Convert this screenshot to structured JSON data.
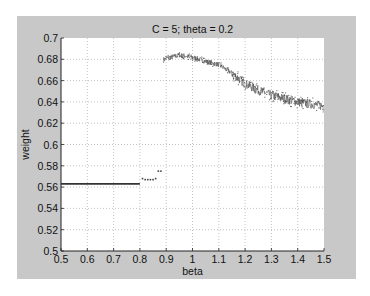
{
  "chart_data": {
    "type": "scatter",
    "title": "C = 5; theta = 0.2",
    "xlabel": "beta",
    "ylabel": "weight",
    "xlim": [
      0.5,
      1.5
    ],
    "ylim": [
      0.5,
      0.7
    ],
    "grid": true,
    "xticks": [
      0.5,
      0.6,
      0.7,
      0.8,
      0.9,
      1,
      1.1,
      1.2,
      1.3,
      1.4,
      1.5
    ],
    "xtick_labels": [
      "0.5",
      "0.6",
      "0.7",
      "0.8",
      "0.9",
      "1",
      "1.1",
      "1.2",
      "1.3",
      "1.4",
      "1.5"
    ],
    "yticks": [
      0.5,
      0.52,
      0.54,
      0.56,
      0.58,
      0.6,
      0.62,
      0.64,
      0.66,
      0.68,
      0.7
    ],
    "ytick_labels": [
      "0.5",
      "0.52",
      "0.54",
      "0.56",
      "0.58",
      "0.6",
      "0.62",
      "0.64",
      "0.66",
      "0.68",
      "0.7"
    ],
    "series": [
      {
        "name": "low-regime",
        "description": "flat segment",
        "x": [
          0.5,
          0.55,
          0.6,
          0.65,
          0.7,
          0.75,
          0.8
        ],
        "y": [
          0.563,
          0.563,
          0.563,
          0.563,
          0.563,
          0.563,
          0.563
        ]
      },
      {
        "name": "transition",
        "x": [
          0.81,
          0.82,
          0.83,
          0.84,
          0.85,
          0.86,
          0.87,
          0.88
        ],
        "y": [
          0.568,
          0.567,
          0.567,
          0.567,
          0.567,
          0.568,
          0.575,
          0.575
        ]
      },
      {
        "name": "high-regime",
        "description": "noisy trend envelope",
        "x": [
          0.89,
          0.9,
          0.95,
          1.0,
          1.05,
          1.1,
          1.15,
          1.2,
          1.25,
          1.3,
          1.35,
          1.4,
          1.45,
          1.5
        ],
        "y": [
          0.679,
          0.681,
          0.684,
          0.682,
          0.678,
          0.675,
          0.667,
          0.657,
          0.651,
          0.646,
          0.643,
          0.64,
          0.638,
          0.636
        ],
        "noise": 0.004
      }
    ]
  }
}
